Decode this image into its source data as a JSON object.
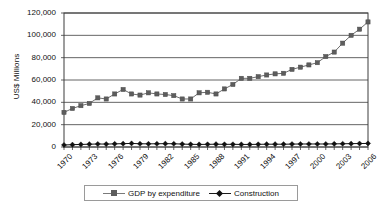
{
  "chart_data": {
    "type": "line",
    "title": "",
    "xlabel": "",
    "ylabel": "US$ Millions",
    "ylim": [
      0,
      120000
    ],
    "ytick_labels": [
      "0",
      "20,000",
      "40,000",
      "60,000",
      "80,000",
      "100,000",
      "120,000"
    ],
    "ytick_values": [
      0,
      20000,
      40000,
      60000,
      80000,
      100000,
      120000
    ],
    "grid": "horizontal",
    "legend_position": "bottom",
    "x": [
      1970,
      1971,
      1972,
      1973,
      1974,
      1975,
      1976,
      1977,
      1978,
      1979,
      1980,
      1981,
      1982,
      1983,
      1984,
      1985,
      1986,
      1987,
      1988,
      1989,
      1990,
      1991,
      1992,
      1993,
      1994,
      1995,
      1996,
      1997,
      1998,
      1999,
      2000,
      2001,
      2002,
      2003,
      2004,
      2005,
      2006
    ],
    "xtick_labels": [
      "1970",
      "1973",
      "1976",
      "1979",
      "1982",
      "1985",
      "1988",
      "1991",
      "1994",
      "1997",
      "2000",
      "2003",
      "2006"
    ],
    "xtick_values": [
      1970,
      1973,
      1976,
      1979,
      1982,
      1985,
      1988,
      1991,
      1994,
      1997,
      2000,
      2003,
      2006
    ],
    "series": [
      {
        "name": "GDP by expenditure",
        "color": "#6e6e6e",
        "marker": "square",
        "values": [
          31000,
          34500,
          37000,
          39000,
          44000,
          43000,
          47500,
          51500,
          47500,
          46500,
          48500,
          47500,
          47000,
          46000,
          43000,
          43000,
          48500,
          49000,
          47500,
          52000,
          56000,
          61500,
          61500,
          63000,
          64500,
          65500,
          66000,
          69500,
          71500,
          73500,
          75500,
          81000,
          85000,
          93000,
          100000,
          105500,
          112000
        ]
      },
      {
        "name": "Construction",
        "color": "#111111",
        "marker": "diamond",
        "values": [
          1800,
          2100,
          2300,
          2500,
          2700,
          2600,
          2800,
          3000,
          3200,
          2900,
          2800,
          2900,
          3000,
          2900,
          2600,
          2400,
          2300,
          2400,
          2500,
          2400,
          2400,
          2300,
          2300,
          2400,
          2500,
          2500,
          2500,
          2600,
          2700,
          2700,
          2700,
          2700,
          2800,
          2900,
          3000,
          3100,
          3200
        ]
      }
    ]
  },
  "legend": {
    "entries": [
      {
        "label": "GDP by expenditure"
      },
      {
        "label": "Construction"
      }
    ]
  }
}
